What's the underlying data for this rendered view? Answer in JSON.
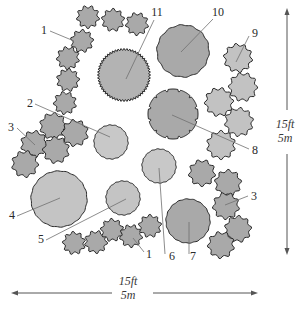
{
  "diagram": {
    "colors": {
      "background": "#ffffff",
      "outline": "#2a2a2a",
      "dark_fill": "#a9a9a9",
      "medium_fill": "#b8b8b8",
      "light_fill": "#c8c8c8",
      "leader": "#707070"
    },
    "scale": {
      "horizontal": {
        "ft": "15ft",
        "m": "5m"
      },
      "vertical": {
        "ft": "15ft",
        "m": "5m"
      }
    },
    "labels": [
      {
        "id": "1",
        "text": "1",
        "x": 47,
        "y": 34,
        "anchor": "end",
        "lx1": 50,
        "ly1": 31,
        "lx2": 74,
        "ly2": 41
      },
      {
        "id": "1b",
        "text": "1",
        "x": 146,
        "y": 258,
        "anchor": "start",
        "lx1": 144,
        "ly1": 252,
        "lx2": 133,
        "ly2": 238
      },
      {
        "id": "2",
        "text": "2",
        "x": 33,
        "y": 107,
        "anchor": "end",
        "lx1": 35,
        "ly1": 104,
        "lx2": 110,
        "ly2": 137
      },
      {
        "id": "3",
        "text": "3",
        "x": 14,
        "y": 131,
        "anchor": "end",
        "lx1": 17,
        "ly1": 128,
        "lx2": 35,
        "ly2": 145
      },
      {
        "id": "3b",
        "text": "3",
        "x": 251,
        "y": 200,
        "anchor": "start",
        "lx1": 248,
        "ly1": 196,
        "lx2": 225,
        "ly2": 205
      },
      {
        "id": "4",
        "text": "4",
        "x": 15,
        "y": 219,
        "anchor": "end",
        "lx1": 17,
        "ly1": 216,
        "lx2": 60,
        "ly2": 198
      },
      {
        "id": "5",
        "text": "5",
        "x": 44,
        "y": 243,
        "anchor": "end",
        "lx1": 46,
        "ly1": 240,
        "lx2": 126,
        "ly2": 199
      },
      {
        "id": "6",
        "text": "6",
        "x": 172,
        "y": 260,
        "anchor": "middle",
        "lx1": 165,
        "ly1": 254,
        "lx2": 159,
        "ly2": 168
      },
      {
        "id": "7",
        "text": "7",
        "x": 193,
        "y": 260,
        "anchor": "middle",
        "lx1": 189,
        "ly1": 254,
        "lx2": 189,
        "ly2": 222
      },
      {
        "id": "8",
        "text": "8",
        "x": 252,
        "y": 154,
        "anchor": "start",
        "lx1": 249,
        "ly1": 149,
        "lx2": 172,
        "ly2": 115
      },
      {
        "id": "9",
        "text": "9",
        "x": 252,
        "y": 37,
        "anchor": "start",
        "lx1": 249,
        "ly1": 36,
        "lx2": 236,
        "ly2": 62
      },
      {
        "id": "10",
        "text": "10",
        "x": 218,
        "y": 16,
        "anchor": "middle",
        "lx1": 213,
        "ly1": 19,
        "lx2": 181,
        "ly2": 52
      },
      {
        "id": "11",
        "text": "11",
        "x": 157,
        "y": 16,
        "anchor": "middle",
        "lx1": 154,
        "ly1": 20,
        "lx2": 126,
        "ly2": 79
      }
    ],
    "trees": [
      {
        "id": "t10",
        "cx": 183,
        "cy": 51,
        "r": 26,
        "fill": "#a9a9a9",
        "style": "wavy"
      },
      {
        "id": "t11",
        "cx": 124,
        "cy": 75,
        "r": 25,
        "fill": "#b3b3b3",
        "style": "serrated"
      },
      {
        "id": "t8",
        "cx": 173,
        "cy": 114,
        "r": 25,
        "fill": "#a9a9a9",
        "style": "notched"
      },
      {
        "id": "t2",
        "cx": 111,
        "cy": 142,
        "r": 17,
        "fill": "#c8c8c8",
        "style": "smooth"
      },
      {
        "id": "t6",
        "cx": 159,
        "cy": 166,
        "r": 17,
        "fill": "#c8c8c8",
        "style": "smooth"
      },
      {
        "id": "t4",
        "cx": 59,
        "cy": 199,
        "r": 28,
        "fill": "#c4c4c4",
        "style": "smooth"
      },
      {
        "id": "t5",
        "cx": 123,
        "cy": 198,
        "r": 17,
        "fill": "#c4c4c4",
        "style": "smooth"
      },
      {
        "id": "t7",
        "cx": 188,
        "cy": 221,
        "r": 22,
        "fill": "#a9a9a9",
        "style": "smooth"
      }
    ],
    "shrubs_dark": [
      {
        "cx": 88,
        "cy": 17,
        "r": 10
      },
      {
        "cx": 113,
        "cy": 20,
        "r": 10
      },
      {
        "cx": 137,
        "cy": 24,
        "r": 10
      },
      {
        "cx": 82,
        "cy": 41,
        "r": 10
      },
      {
        "cx": 68,
        "cy": 58,
        "r": 10
      },
      {
        "cx": 68,
        "cy": 80,
        "r": 10
      },
      {
        "cx": 65,
        "cy": 103,
        "r": 10
      },
      {
        "cx": 53,
        "cy": 126,
        "r": 12
      },
      {
        "cx": 75,
        "cy": 133,
        "r": 12
      },
      {
        "cx": 34,
        "cy": 144,
        "r": 12
      },
      {
        "cx": 56,
        "cy": 150,
        "r": 12
      },
      {
        "cx": 25,
        "cy": 164,
        "r": 12
      },
      {
        "cx": 74,
        "cy": 243,
        "r": 10
      },
      {
        "cx": 96,
        "cy": 242,
        "r": 10
      },
      {
        "cx": 112,
        "cy": 230,
        "r": 10
      },
      {
        "cx": 131,
        "cy": 236,
        "r": 10
      },
      {
        "cx": 150,
        "cy": 226,
        "r": 10
      },
      {
        "cx": 202,
        "cy": 173,
        "r": 12
      },
      {
        "cx": 228,
        "cy": 183,
        "r": 12
      },
      {
        "cx": 226,
        "cy": 206,
        "r": 12
      },
      {
        "cx": 238,
        "cy": 229,
        "r": 12
      },
      {
        "cx": 221,
        "cy": 245,
        "r": 12
      }
    ],
    "shrubs_light": [
      {
        "cx": 238,
        "cy": 58,
        "r": 13
      },
      {
        "cx": 243,
        "cy": 87,
        "r": 13
      },
      {
        "cx": 219,
        "cy": 102,
        "r": 13
      },
      {
        "cx": 239,
        "cy": 122,
        "r": 13
      },
      {
        "cx": 221,
        "cy": 145,
        "r": 13
      }
    ]
  }
}
